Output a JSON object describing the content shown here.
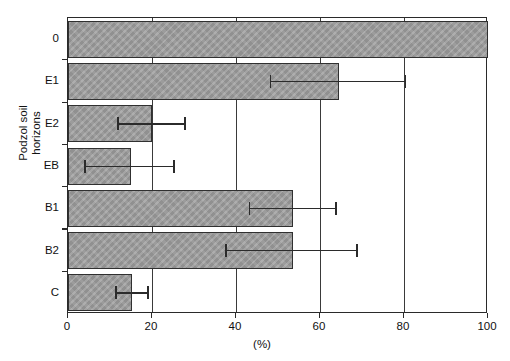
{
  "chart_data": {
    "type": "bar",
    "orientation": "horizontal",
    "title": "",
    "xlabel": "(%)",
    "ylabel": "Podzol soil\nhorizons",
    "xlim": [
      0,
      100
    ],
    "xticks": [
      0,
      20,
      40,
      60,
      80,
      100
    ],
    "xtick_labels": [
      "0",
      "20",
      "40",
      "60",
      "80",
      "100"
    ],
    "grid": true,
    "grid_axis": "x",
    "legend": null,
    "categories": [
      "0",
      "E1",
      "E2",
      "EB",
      "B1",
      "B2",
      "C"
    ],
    "values": [
      100,
      64.5,
      20,
      15,
      53.5,
      53.5,
      15.2
    ],
    "error_low": [
      null,
      48,
      11.7,
      3.8,
      43,
      37.4,
      11.2
    ],
    "error_high": [
      null,
      80.5,
      28,
      25.5,
      64,
      69,
      19.3
    ],
    "bar_color": "#9b9b9b",
    "bar_edge_color": "#303030",
    "error_color": "#2b2b2b",
    "axis_color": "#2a2a2a",
    "points": [
      {
        "category": "0",
        "value": 100,
        "err_low": null,
        "err_high": null
      },
      {
        "category": "E1",
        "value": 64.5,
        "err_low": 48,
        "err_high": 80.5
      },
      {
        "category": "E2",
        "value": 20,
        "err_low": 11.7,
        "err_high": 28
      },
      {
        "category": "EB",
        "value": 15,
        "err_low": 3.8,
        "err_high": 25.5
      },
      {
        "category": "B1",
        "value": 53.5,
        "err_low": 43,
        "err_high": 64
      },
      {
        "category": "B2",
        "value": 53.5,
        "err_low": 37.4,
        "err_high": 69
      },
      {
        "category": "C",
        "value": 15.2,
        "err_low": 11.2,
        "err_high": 19.3
      }
    ]
  }
}
